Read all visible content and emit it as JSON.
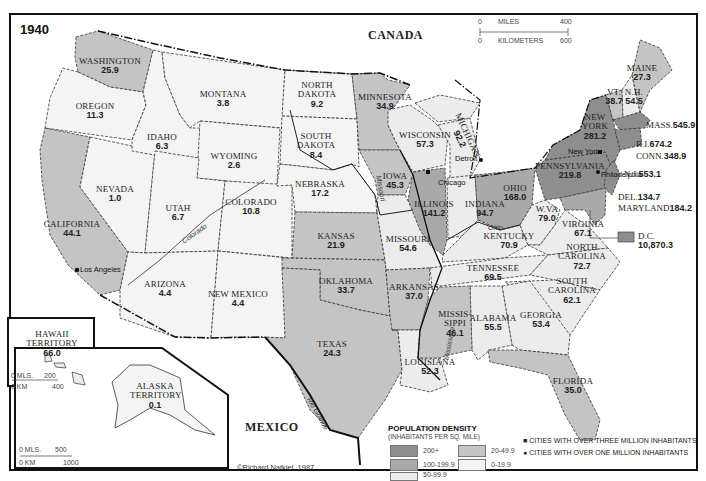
{
  "map": {
    "year": "1940",
    "credit": "©Richard Natkiel, 1987",
    "countries": {
      "north": "CANADA",
      "south": "MEXICO"
    },
    "colors": {
      "200+": "#8e8e8e",
      "100-199.9": "#a9a9a9",
      "50-99.9": "#ececec",
      "20-49.9": "#c4c4c4",
      "0-19.9": "#f4f4f4",
      "water": "#ffffff",
      "border": "#222222"
    },
    "scale_main": {
      "miles_label": "MILES",
      "km_label": "KILOMETERS",
      "mi_zero": "0",
      "mi_max": "400",
      "km_zero": "0",
      "km_max": "600"
    },
    "scale_hawaii": {
      "mi_label": "MLS.",
      "km_label": "KM",
      "mi_zero": "0",
      "mi_max": "200",
      "km_zero": "0",
      "km_max": "400"
    },
    "scale_alaska": {
      "mi_label": "MLS.",
      "km_label": "KM",
      "mi_zero": "0",
      "mi_max": "500",
      "km_zero": "0",
      "km_max": "1000"
    }
  },
  "states": {
    "washington": {
      "name": "WASHINGTON",
      "value": "25.9",
      "class": "20-49.9"
    },
    "oregon": {
      "name": "OREGON",
      "value": "11.3",
      "class": "0-19.9"
    },
    "california": {
      "name": "CALIFORNIA",
      "value": "44.1",
      "class": "20-49.9"
    },
    "idaho": {
      "name": "IDAHO",
      "value": "6.3",
      "class": "0-19.9"
    },
    "nevada": {
      "name": "NEVADA",
      "value": "1.0",
      "class": "0-19.9"
    },
    "montana": {
      "name": "MONTANA",
      "value": "3.8",
      "class": "0-19.9"
    },
    "wyoming": {
      "name": "WYOMING",
      "value": "2.6",
      "class": "0-19.9"
    },
    "utah": {
      "name": "UTAH",
      "value": "6.7",
      "class": "0-19.9"
    },
    "arizona": {
      "name": "ARIZONA",
      "value": "4.4",
      "class": "0-19.9"
    },
    "colorado": {
      "name": "COLORADO",
      "value": "10.8",
      "class": "0-19.9"
    },
    "new_mexico": {
      "name": "NEW MEXICO",
      "value": "4.4",
      "class": "0-19.9"
    },
    "north_dakota": {
      "name": "NORTH DAKOTA",
      "value": "9.2",
      "class": "0-19.9"
    },
    "south_dakota": {
      "name": "SOUTH DAKOTA",
      "value": "8.4",
      "class": "0-19.9"
    },
    "nebraska": {
      "name": "NEBRASKA",
      "value": "17.2",
      "class": "0-19.9"
    },
    "kansas": {
      "name": "KANSAS",
      "value": "21.9",
      "class": "20-49.9"
    },
    "oklahoma": {
      "name": "OKLAHOMA",
      "value": "33.7",
      "class": "20-49.9"
    },
    "texas": {
      "name": "TEXAS",
      "value": "24.3",
      "class": "20-49.9"
    },
    "minnesota": {
      "name": "MINNESOTA",
      "value": "34.9",
      "class": "20-49.9"
    },
    "iowa": {
      "name": "IOWA",
      "value": "45.3",
      "class": "20-49.9"
    },
    "missouri": {
      "name": "MISSOURI",
      "value": "54.6",
      "class": "50-99.9"
    },
    "arkansas": {
      "name": "ARKANSAS",
      "value": "37.0",
      "class": "20-49.9"
    },
    "louisiana": {
      "name": "LOUISIANA",
      "value": "52.3",
      "class": "50-99.9"
    },
    "wisconsin": {
      "name": "WISCONSIN",
      "value": "57.3",
      "class": "50-99.9"
    },
    "illinois": {
      "name": "ILLINOIS",
      "value": "141.2",
      "class": "100-199.9"
    },
    "michigan": {
      "name": "MICHIGAN",
      "value": "92.2",
      "class": "50-99.9"
    },
    "indiana": {
      "name": "INDIANA",
      "value": "94.7",
      "class": "50-99.9"
    },
    "ohio": {
      "name": "OHIO",
      "value": "168.0",
      "class": "100-199.9"
    },
    "kentucky": {
      "name": "KENTUCKY",
      "value": "70.9",
      "class": "50-99.9"
    },
    "tennessee": {
      "name": "TENNESSEE",
      "value": "69.5",
      "class": "50-99.9"
    },
    "mississippi": {
      "name": "MISSIS-SIPPI",
      "value": "46.1",
      "class": "20-49.9"
    },
    "alabama": {
      "name": "ALABAMA",
      "value": "55.5",
      "class": "50-99.9"
    },
    "georgia": {
      "name": "GEORGIA",
      "value": "53.4",
      "class": "50-99.9"
    },
    "florida": {
      "name": "FLORIDA",
      "value": "35.0",
      "class": "20-49.9"
    },
    "south_carolina": {
      "name": "SOUTH CAROLINA",
      "value": "62.1",
      "class": "50-99.9"
    },
    "north_carolina": {
      "name": "NORTH CAROLINA",
      "value": "72.7",
      "class": "50-99.9"
    },
    "virginia": {
      "name": "VIRGINIA",
      "value": "67.1",
      "class": "50-99.9"
    },
    "west_virginia": {
      "name": "W.VA",
      "value": "79.0",
      "class": "50-99.9"
    },
    "pennsylvania": {
      "name": "PENNSYLVANIA",
      "value": "219.8",
      "class": "200+"
    },
    "new_york": {
      "name": "NEW YORK",
      "value": "281.2",
      "class": "200+"
    },
    "vermont": {
      "name": "VT.",
      "value": "38.7",
      "class": "20-49.9"
    },
    "new_hampshire": {
      "name": "N.H.",
      "value": "54.5",
      "class": "50-99.9"
    },
    "maine": {
      "name": "MAINE",
      "value": "27.3",
      "class": "20-49.9"
    },
    "massachusetts": {
      "name": "MASS.",
      "value": "545.9",
      "class": "200+"
    },
    "rhode_island": {
      "name": "R.I.",
      "value": "674.2",
      "class": "200+"
    },
    "connecticut": {
      "name": "CONN.",
      "value": "348.9",
      "class": "200+"
    },
    "new_jersey": {
      "name": "N.J.",
      "value": "553.1",
      "class": "200+"
    },
    "delaware": {
      "name": "DEL.",
      "value": "134.7",
      "class": "100-199.9"
    },
    "maryland": {
      "name": "MARYLAND",
      "value": "184.2",
      "class": "100-199.9"
    },
    "dc": {
      "name": "D.C.",
      "value": "10,870.3",
      "class": "200+"
    },
    "hawaii": {
      "name": "HAWAII TERRITORY",
      "value": "66.0",
      "class": "50-99.9"
    },
    "alaska": {
      "name": "ALASKA TERRITORY",
      "value": "0.1",
      "class": "0-19.9"
    }
  },
  "cities": [
    {
      "name": "Los Angeles",
      "type": "over-one-million"
    },
    {
      "name": "Chicago",
      "type": "over-three-million"
    },
    {
      "name": "Detroit",
      "type": "over-one-million"
    },
    {
      "name": "New York",
      "type": "over-three-million"
    },
    {
      "name": "Philadelphia",
      "type": "over-one-million"
    }
  ],
  "rivers": [
    "Missouri",
    "Mississippi",
    "Ohio",
    "Colorado",
    "Rio Grande"
  ],
  "legend": {
    "title": "POPULATION DENSITY",
    "subtitle": "(INHABITANTS PER SQ. MILE)",
    "items": [
      {
        "label": "200+",
        "color": "#8e8e8e"
      },
      {
        "label": "100-199.9",
        "color": "#a9a9a9"
      },
      {
        "label": "50-99.9",
        "color": "#ececec"
      },
      {
        "label": "20-49.9",
        "color": "#c4c4c4"
      },
      {
        "label": "0-19.9",
        "color": "#f4f4f4"
      }
    ],
    "city_keys": [
      {
        "symbol": "square",
        "label": "CITIES WITH OVER THREE MILLION INHABITANTS"
      },
      {
        "symbol": "dot",
        "label": "CITIES WITH OVER ONE MILLION INHABITANTS"
      }
    ]
  }
}
